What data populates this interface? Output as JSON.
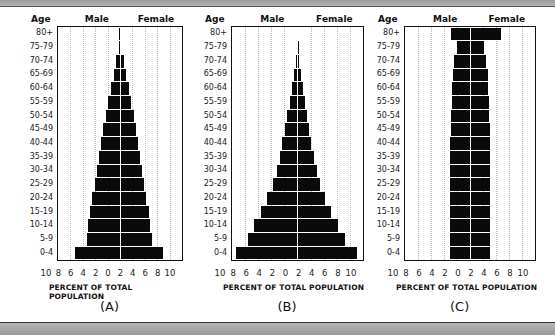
{
  "chart_data": [
    {
      "type": "bar",
      "orientation": "horizontal",
      "subtype": "population-pyramid",
      "title": "(A)",
      "caption": "(A)",
      "xlabel": "PERCENT OF TOTAL POPULATION",
      "ylabel": "Age",
      "left_label": "Male",
      "right_label": "Female",
      "categories": [
        "80+",
        "75-79",
        "70-74",
        "65-69",
        "60-64",
        "55-59",
        "50-54",
        "45-49",
        "40-44",
        "35-39",
        "30-34",
        "25-29",
        "20-24",
        "15-19",
        "10-14",
        "5-9",
        "0-4"
      ],
      "series": [
        {
          "name": "Male",
          "values": [
            0.1,
            0.1,
            0.6,
            1.0,
            1.4,
            1.9,
            2.3,
            2.7,
            3.0,
            3.4,
            3.7,
            4.1,
            4.5,
            4.9,
            5.1,
            5.3,
            7.2
          ]
        },
        {
          "name": "Female",
          "values": [
            0.1,
            0.1,
            0.6,
            1.0,
            1.4,
            1.8,
            2.2,
            2.6,
            2.9,
            3.2,
            3.5,
            3.9,
            4.2,
            4.6,
            4.9,
            5.1,
            7.0
          ]
        }
      ],
      "xticks": [
        "10",
        "8",
        "6",
        "4",
        "2",
        "0",
        "2",
        "4",
        "6",
        "8",
        "10"
      ],
      "xlim": [
        -10,
        10
      ],
      "grid": true
    },
    {
      "type": "bar",
      "orientation": "horizontal",
      "subtype": "population-pyramid",
      "title": "(B)",
      "caption": "(B)",
      "xlabel": "PERCENT OF TOTAL POPULATION",
      "ylabel": "Age",
      "left_label": "Male",
      "right_label": "Female",
      "categories": [
        "80+",
        "75-79",
        "70-74",
        "65-69",
        "60-64",
        "55-59",
        "50-54",
        "45-49",
        "40-44",
        "35-39",
        "30-34",
        "25-29",
        "20-24",
        "15-19",
        "10-14",
        "5-9",
        "0-4"
      ],
      "series": [
        {
          "name": "Male",
          "values": [
            0.0,
            0.1,
            0.3,
            0.6,
            0.9,
            1.2,
            1.6,
            1.9,
            2.3,
            2.7,
            3.2,
            3.8,
            4.6,
            5.6,
            6.6,
            7.6,
            9.4
          ]
        },
        {
          "name": "Female",
          "values": [
            0.0,
            0.1,
            0.3,
            0.6,
            0.9,
            1.2,
            1.5,
            1.8,
            2.1,
            2.5,
            3.0,
            3.5,
            4.2,
            5.1,
            6.2,
            7.2,
            9.1
          ]
        }
      ],
      "xticks": [
        "10",
        "8",
        "6",
        "4",
        "2",
        "0",
        "2",
        "4",
        "6",
        "8",
        "10"
      ],
      "xlim": [
        -10,
        10
      ],
      "grid": true
    },
    {
      "type": "bar",
      "orientation": "horizontal",
      "subtype": "population-pyramid",
      "title": "(C)",
      "caption": "(C)",
      "xlabel": "PERCENT OF TOTAL POPULATION",
      "ylabel": "Age",
      "left_label": "Male",
      "right_label": "Female",
      "categories": [
        "80+",
        "75-79",
        "70-74",
        "65-69",
        "60-64",
        "55-59",
        "50-54",
        "45-49",
        "40-44",
        "35-39",
        "30-34",
        "25-29",
        "20-24",
        "15-19",
        "10-14",
        "5-9",
        "0-4"
      ],
      "series": [
        {
          "name": "Male",
          "values": [
            3.0,
            2.0,
            2.4,
            2.6,
            2.7,
            2.8,
            2.9,
            3.0,
            3.1,
            3.1,
            3.1,
            3.1,
            3.1,
            3.1,
            3.1,
            3.1,
            3.1
          ]
        },
        {
          "name": "Female",
          "values": [
            4.7,
            2.2,
            2.5,
            2.7,
            2.8,
            2.9,
            2.9,
            3.0,
            3.0,
            3.0,
            3.0,
            3.0,
            3.0,
            3.0,
            3.0,
            3.0,
            3.0
          ]
        }
      ],
      "xticks": [
        "10",
        "8",
        "6",
        "4",
        "2",
        "0",
        "2",
        "4",
        "6",
        "8",
        "10"
      ],
      "xlim": [
        -10,
        10
      ],
      "grid": true
    }
  ],
  "labels": {
    "age": "Age",
    "male": "Male",
    "female": "Female",
    "xlabel": "PERCENT OF TOTAL POPULATION",
    "captions": [
      "(A)",
      "(B)",
      "(C)"
    ]
  },
  "colors": {
    "bar": "#0a0a0a",
    "frame": "#111111",
    "grid": "#b8b8b8",
    "band": "#a8a8a8"
  }
}
